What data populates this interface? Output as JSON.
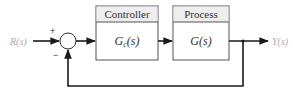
{
  "diagram": {
    "type": "feedback-control-block-diagram",
    "input": {
      "label": "R(s)"
    },
    "output": {
      "label": "Y(s)"
    },
    "summing_junction": {
      "plus_sign": "+",
      "minus_sign": "−"
    },
    "blocks": [
      {
        "header": "Controller",
        "transfer_function": {
          "base": "G",
          "subscript": "c",
          "arg": "(s)"
        }
      },
      {
        "header": "Process",
        "transfer_function": {
          "base": "G",
          "subscript": "",
          "arg": "(s)"
        }
      }
    ],
    "feedback": {
      "type": "unity-negative"
    },
    "colors": {
      "line": "#1a1a1a",
      "header_fill": "#eeeeee",
      "box_stroke": "#555555",
      "io_label": "#aaaaaa"
    }
  }
}
